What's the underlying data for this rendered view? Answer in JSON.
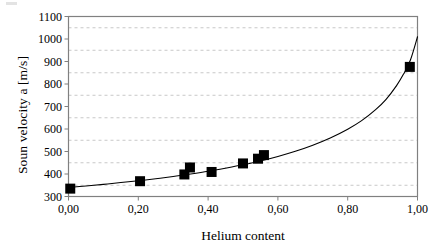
{
  "chart_data": {
    "type": "scatter",
    "title": "",
    "xlabel": "Helium content",
    "ylabel": "Soun velocity a  [m/s]",
    "xlim": [
      0.0,
      1.0
    ],
    "ylim": [
      300,
      1100
    ],
    "x_tick_labels": [
      "0,00",
      "0,20",
      "0,40",
      "0,60",
      "0,80",
      "1,00"
    ],
    "x_tick_values": [
      0.0,
      0.2,
      0.4,
      0.6,
      0.8,
      1.0
    ],
    "y_tick_labels": [
      "300",
      "400",
      "500",
      "600",
      "700",
      "800",
      "900",
      "1000",
      "1100"
    ],
    "y_tick_values": [
      300,
      400,
      500,
      600,
      700,
      800,
      900,
      1000,
      1100
    ],
    "grid": true,
    "grid_axis": "y",
    "grid_style": "dashed",
    "grid_values": [
      350,
      450,
      550,
      650,
      750,
      850,
      950,
      1050
    ],
    "legend": "none",
    "marker": "filled-square",
    "marker_color": "#000000",
    "line_color": "#000000",
    "series": [
      {
        "name": "measured",
        "type": "scatter",
        "points": [
          {
            "x": 0.005,
            "y": 335
          },
          {
            "x": 0.205,
            "y": 368
          },
          {
            "x": 0.332,
            "y": 398
          },
          {
            "x": 0.348,
            "y": 429
          },
          {
            "x": 0.41,
            "y": 409
          },
          {
            "x": 0.5,
            "y": 447
          },
          {
            "x": 0.543,
            "y": 468
          },
          {
            "x": 0.56,
            "y": 484
          },
          {
            "x": 0.978,
            "y": 876
          }
        ]
      },
      {
        "name": "fitted curve",
        "type": "line",
        "points": [
          {
            "x": 0.0,
            "y": 340
          },
          {
            "x": 0.05,
            "y": 347
          },
          {
            "x": 0.1,
            "y": 354
          },
          {
            "x": 0.15,
            "y": 362
          },
          {
            "x": 0.2,
            "y": 370
          },
          {
            "x": 0.25,
            "y": 379
          },
          {
            "x": 0.3,
            "y": 389
          },
          {
            "x": 0.35,
            "y": 400
          },
          {
            "x": 0.4,
            "y": 412
          },
          {
            "x": 0.45,
            "y": 426
          },
          {
            "x": 0.5,
            "y": 441
          },
          {
            "x": 0.55,
            "y": 458
          },
          {
            "x": 0.6,
            "y": 478
          },
          {
            "x": 0.65,
            "y": 501
          },
          {
            "x": 0.7,
            "y": 528
          },
          {
            "x": 0.75,
            "y": 560
          },
          {
            "x": 0.8,
            "y": 599
          },
          {
            "x": 0.84,
            "y": 637
          },
          {
            "x": 0.88,
            "y": 686
          },
          {
            "x": 0.91,
            "y": 732
          },
          {
            "x": 0.94,
            "y": 793
          },
          {
            "x": 0.96,
            "y": 844
          },
          {
            "x": 0.98,
            "y": 908
          },
          {
            "x": 1.0,
            "y": 1010
          }
        ]
      }
    ]
  },
  "axes": {
    "frame_color": "#808080",
    "grid_color": "#c8c8c8",
    "data_color": "#000000"
  }
}
